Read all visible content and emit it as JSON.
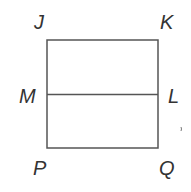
{
  "diagram": {
    "type": "geometry-figure",
    "shape": "rectangle divided by horizontal segment",
    "vertices": {
      "J": "J",
      "K": "K",
      "L": "L",
      "M": "M",
      "P": "P",
      "Q": "Q"
    },
    "segments": [
      "JK",
      "KQ",
      "QP",
      "PJ",
      "ML"
    ],
    "colors": {
      "stroke": "#555555",
      "label": "#333333"
    },
    "mark": "、"
  }
}
